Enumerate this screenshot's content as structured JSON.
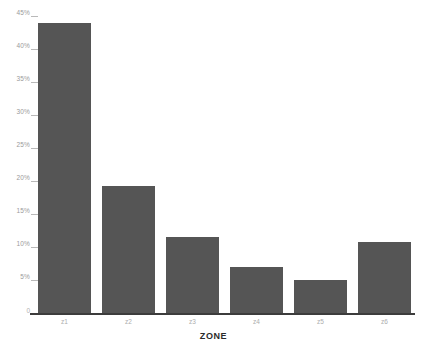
{
  "chart_data": {
    "type": "bar",
    "title": "",
    "subtitle": "",
    "xlabel": "ZONE",
    "ylabel": "",
    "categories": [
      "z1",
      "z2",
      "z3",
      "z4",
      "z5",
      "z6"
    ],
    "values": [
      44.0,
      19.3,
      11.5,
      7.0,
      5.0,
      10.8
    ],
    "series": [
      {
        "name": "percent",
        "values": [
          44.0,
          19.3,
          11.5,
          7.0,
          5.0,
          10.8
        ]
      }
    ],
    "ylim": [
      0,
      45
    ],
    "ytick_values": [
      0,
      5,
      10,
      15,
      20,
      25,
      30,
      35,
      40,
      45
    ],
    "ytick_labels": [
      "0",
      "5%",
      "10%",
      "15%",
      "20%",
      "25%",
      "30%",
      "35%",
      "40%",
      "45%"
    ],
    "xtick_labels": [
      "z1",
      "z2",
      "z3",
      "z4",
      "z5",
      "z6"
    ],
    "grid": false,
    "legend": null,
    "legend_position": "none",
    "bar_color": "#555555",
    "axis_color": "#3c3c3c",
    "tick_label_color": "#9a9a9a",
    "background_color": "#ffffff",
    "annotations": []
  }
}
